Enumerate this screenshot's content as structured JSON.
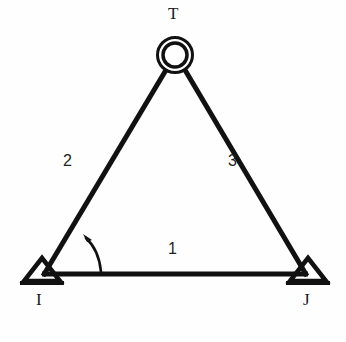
{
  "diagram": {
    "type": "structural-truss",
    "background_color": "#fefefe",
    "line_color": "#111111",
    "nodes": [
      {
        "id": "T",
        "label": "T",
        "kind": "ring-joint",
        "x": 175,
        "y": 55
      },
      {
        "id": "I",
        "label": "I",
        "kind": "pin-support",
        "x": 42,
        "y": 274
      },
      {
        "id": "J",
        "label": "J",
        "kind": "pin-support",
        "x": 308,
        "y": 274
      }
    ],
    "members": [
      {
        "id": "1",
        "label": "1",
        "from": "I",
        "to": "J"
      },
      {
        "id": "2",
        "label": "2",
        "from": "I",
        "to": "T"
      },
      {
        "id": "3",
        "label": "3",
        "from": "T",
        "to": "J"
      }
    ],
    "angle_marker": {
      "name": "angle-arc-at-node-i",
      "at_node": "I",
      "between_members": [
        "1",
        "2"
      ],
      "direction": "counterclockwise"
    }
  }
}
